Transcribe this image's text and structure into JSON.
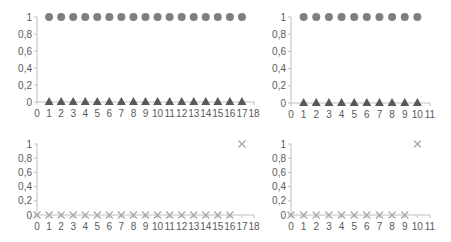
{
  "chart_data": [
    {
      "type": "scatter",
      "position": "top-left",
      "title": "",
      "xlabel": "",
      "ylabel": "",
      "xlim": [
        0,
        18
      ],
      "ylim": [
        0,
        1
      ],
      "xticks": [
        "0",
        "1",
        "2",
        "3",
        "4",
        "5",
        "6",
        "7",
        "8",
        "9",
        "10",
        "11",
        "12",
        "13",
        "14",
        "15",
        "16",
        "17",
        "18"
      ],
      "yticks": [
        "0",
        "0,2",
        "0,4",
        "0,6",
        "0,8",
        "1"
      ],
      "grid": false,
      "legend": null,
      "series": [
        {
          "name": "circles",
          "marker": "circle",
          "color": "#7f7f7f",
          "x": [
            1,
            2,
            3,
            4,
            5,
            6,
            7,
            8,
            9,
            10,
            11,
            12,
            13,
            14,
            15,
            16,
            17
          ],
          "y": [
            1,
            1,
            1,
            1,
            1,
            1,
            1,
            1,
            1,
            1,
            1,
            1,
            1,
            1,
            1,
            1,
            1
          ]
        },
        {
          "name": "triangles",
          "marker": "triangle",
          "color": "#595959",
          "x": [
            1,
            2,
            3,
            4,
            5,
            6,
            7,
            8,
            9,
            10,
            11,
            12,
            13,
            14,
            15,
            16,
            17
          ],
          "y": [
            0,
            0,
            0,
            0,
            0,
            0,
            0,
            0,
            0,
            0,
            0,
            0,
            0,
            0,
            0,
            0,
            0
          ]
        }
      ]
    },
    {
      "type": "scatter",
      "position": "top-right",
      "title": "",
      "xlabel": "",
      "ylabel": "",
      "xlim": [
        0,
        11
      ],
      "ylim": [
        0,
        1
      ],
      "xticks": [
        "0",
        "1",
        "2",
        "3",
        "4",
        "5",
        "6",
        "7",
        "8",
        "9",
        "10",
        "11"
      ],
      "yticks": [
        "0",
        "0,2",
        "0,4",
        "0,6",
        "0,8",
        "1"
      ],
      "grid": false,
      "legend": null,
      "series": [
        {
          "name": "circles",
          "marker": "circle",
          "color": "#7f7f7f",
          "x": [
            1,
            2,
            3,
            4,
            5,
            6,
            7,
            8,
            9,
            10
          ],
          "y": [
            1,
            1,
            1,
            1,
            1,
            1,
            1,
            1,
            1,
            1
          ]
        },
        {
          "name": "triangles",
          "marker": "triangle",
          "color": "#595959",
          "x": [
            1,
            2,
            3,
            4,
            5,
            6,
            7,
            8,
            9,
            10
          ],
          "y": [
            0,
            0,
            0,
            0,
            0,
            0,
            0,
            0,
            0,
            0
          ]
        }
      ]
    },
    {
      "type": "scatter",
      "position": "bottom-left",
      "title": "",
      "xlabel": "",
      "ylabel": "",
      "xlim": [
        0,
        18
      ],
      "ylim": [
        0,
        1
      ],
      "xticks": [
        "0",
        "1",
        "2",
        "3",
        "4",
        "5",
        "6",
        "7",
        "8",
        "9",
        "10",
        "11",
        "12",
        "13",
        "14",
        "15",
        "16",
        "17",
        "18"
      ],
      "yticks": [
        "0",
        "0,2",
        "0,4",
        "0,6",
        "0,8",
        "1"
      ],
      "grid": false,
      "legend": null,
      "series": [
        {
          "name": "crosses",
          "marker": "x",
          "color": "#a6a6a6",
          "x": [
            0,
            1,
            2,
            3,
            4,
            5,
            6,
            7,
            8,
            9,
            10,
            11,
            12,
            13,
            14,
            15,
            16,
            17
          ],
          "y": [
            0,
            0,
            0,
            0,
            0,
            0,
            0,
            0,
            0,
            0,
            0,
            0,
            0,
            0,
            0,
            0,
            0,
            1
          ]
        }
      ]
    },
    {
      "type": "scatter",
      "position": "bottom-right",
      "title": "",
      "xlabel": "",
      "ylabel": "",
      "xlim": [
        0,
        11
      ],
      "ylim": [
        0,
        1
      ],
      "xticks": [
        "0",
        "1",
        "2",
        "3",
        "4",
        "5",
        "6",
        "7",
        "8",
        "9",
        "10",
        "11"
      ],
      "yticks": [
        "0",
        "0,2",
        "0,4",
        "0,6",
        "0,8",
        "1"
      ],
      "grid": false,
      "legend": null,
      "series": [
        {
          "name": "crosses",
          "marker": "x",
          "color": "#a6a6a6",
          "x": [
            0,
            1,
            2,
            3,
            4,
            5,
            6,
            7,
            8,
            9,
            10
          ],
          "y": [
            0,
            0,
            0,
            0,
            0,
            0,
            0,
            0,
            0,
            0,
            1
          ]
        }
      ]
    }
  ],
  "layout": {
    "axis_color": "#bfbfbf",
    "label_color": "#595959",
    "charts": [
      {
        "x0": 37,
        "x1": 254,
        "y0": 102,
        "y1": 17
      },
      {
        "x0": 291,
        "x1": 430,
        "y0": 103,
        "y1": 17
      },
      {
        "x0": 37,
        "x1": 254,
        "y0": 215,
        "y1": 144
      },
      {
        "x0": 291,
        "x1": 430,
        "y0": 215,
        "y1": 144
      }
    ]
  }
}
